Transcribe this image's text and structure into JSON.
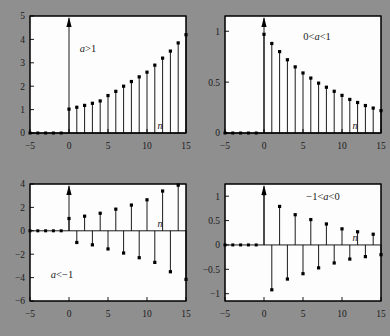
{
  "figure": {
    "background_color": "#8f8f8f",
    "plot_background_color": "#fdfdfd",
    "line_color": "#000000",
    "panel_count": 4
  },
  "chart_data": [
    {
      "type": "stem",
      "id": "panel-a-greater-1",
      "title": "",
      "annotation": "a>1",
      "annotation_parts": {
        "pre": "",
        "var": "a",
        "post": ">1"
      },
      "xlabel": "n",
      "ylabel": "",
      "xlim": [
        -5,
        15
      ],
      "ylim": [
        0,
        5
      ],
      "xticks": [
        -5,
        0,
        5,
        10,
        15
      ],
      "xticklabels": [
        "-5",
        "0",
        "5",
        "10",
        "15"
      ],
      "yticks": [
        0,
        1,
        2,
        3,
        4,
        5
      ],
      "yticklabels": [
        "0",
        "1",
        "2",
        "3",
        "4",
        "5"
      ],
      "grid": false,
      "legend": false,
      "arrow_at_x": 0,
      "arrow_note": "stem at n=0 drawn as upward arrow beyond axis top",
      "x": [
        -5,
        -4,
        -3,
        -2,
        -1,
        0,
        1,
        2,
        3,
        4,
        5,
        6,
        7,
        8,
        9,
        10,
        11,
        12,
        13,
        14,
        15
      ],
      "values": [
        0,
        0,
        0,
        0,
        0,
        1.02,
        1.1,
        1.18,
        1.27,
        1.37,
        1.6,
        1.78,
        2.0,
        2.2,
        2.4,
        2.6,
        2.9,
        3.2,
        3.5,
        3.85,
        4.2
      ]
    },
    {
      "type": "stem",
      "id": "panel-0-less-a-less-1",
      "title": "",
      "annotation": "0<a<1",
      "annotation_parts": {
        "pre": "0<",
        "var": "a",
        "post": "<1"
      },
      "xlabel": "n",
      "ylabel": "",
      "xlim": [
        -5,
        15
      ],
      "ylim": [
        0,
        1.15
      ],
      "xticks": [
        -5,
        0,
        5,
        10,
        15
      ],
      "xticklabels": [
        "-5",
        "0",
        "5",
        "10",
        "15"
      ],
      "yticks": [
        0,
        0.5,
        1
      ],
      "yticklabels": [
        "0",
        "0.5",
        "1"
      ],
      "grid": false,
      "legend": false,
      "arrow_at_x": 0,
      "arrow_note": "stem at n=0 drawn as upward arrow beyond axis top",
      "x": [
        -5,
        -4,
        -3,
        -2,
        -1,
        0,
        1,
        2,
        3,
        4,
        5,
        6,
        7,
        8,
        9,
        10,
        11,
        12,
        13,
        14,
        15
      ],
      "values": [
        0,
        0,
        0,
        0,
        0,
        0.97,
        0.88,
        0.8,
        0.72,
        0.65,
        0.59,
        0.54,
        0.49,
        0.45,
        0.41,
        0.37,
        0.33,
        0.3,
        0.27,
        0.245,
        0.22
      ]
    },
    {
      "type": "stem",
      "id": "panel-a-less-minus-1",
      "title": "",
      "annotation": "a<-1",
      "annotation_parts": {
        "pre": "",
        "var": "a",
        "post": "<-1"
      },
      "xlabel": "n",
      "ylabel": "",
      "xlim": [
        -5,
        15
      ],
      "ylim": [
        -6,
        4
      ],
      "xticks": [
        -5,
        0,
        5,
        10,
        15
      ],
      "xticklabels": [
        "-5",
        "0",
        "5",
        "10",
        "15"
      ],
      "yticks": [
        -6,
        -4,
        -2,
        0,
        2,
        4
      ],
      "yticklabels": [
        "-6",
        "-4",
        "-2",
        "0",
        "2",
        "4"
      ],
      "grid": false,
      "legend": false,
      "arrow_at_x": 0,
      "arrow_note": "stem at n=0 drawn as upward arrow beyond axis top",
      "x": [
        -5,
        -4,
        -3,
        -2,
        -1,
        0,
        1,
        2,
        3,
        4,
        5,
        6,
        7,
        8,
        9,
        10,
        11,
        12,
        13,
        14,
        15
      ],
      "values": [
        0,
        0,
        0,
        0,
        0,
        1.05,
        -1.0,
        1.25,
        -1.2,
        1.5,
        -1.55,
        1.85,
        -1.9,
        2.2,
        -2.3,
        2.65,
        -2.7,
        3.4,
        -3.5,
        3.9,
        -4.15
      ]
    },
    {
      "type": "stem",
      "id": "panel-minus-1-less-a-less-0",
      "title": "",
      "annotation": "-1<a<0",
      "annotation_parts": {
        "pre": "-1<",
        "var": "a",
        "post": "<0"
      },
      "xlabel": "n",
      "ylabel": "",
      "xlim": [
        -5,
        15
      ],
      "ylim": [
        -1.15,
        1.25
      ],
      "xticks": [
        -5,
        0,
        5,
        10,
        15
      ],
      "xticklabels": [
        "-5",
        "0",
        "5",
        "10",
        "15"
      ],
      "yticks": [
        -1,
        -0.5,
        0,
        0.5,
        1
      ],
      "yticklabels": [
        "-1",
        "-0.5",
        "0",
        "0.5",
        "1"
      ],
      "grid": false,
      "legend": false,
      "arrow_at_x": 0,
      "arrow_note": "stem at n=0 drawn as upward arrow beyond axis top",
      "x": [
        -5,
        -4,
        -3,
        -2,
        -1,
        0,
        1,
        2,
        3,
        4,
        5,
        6,
        7,
        8,
        9,
        10,
        11,
        12,
        13,
        14,
        15
      ],
      "values": [
        0,
        0,
        0,
        0,
        0,
        1.05,
        -0.92,
        0.79,
        -0.7,
        0.62,
        -0.59,
        0.52,
        -0.47,
        0.43,
        -0.37,
        0.33,
        -0.29,
        0.27,
        -0.24,
        0.22,
        -0.2
      ]
    }
  ]
}
